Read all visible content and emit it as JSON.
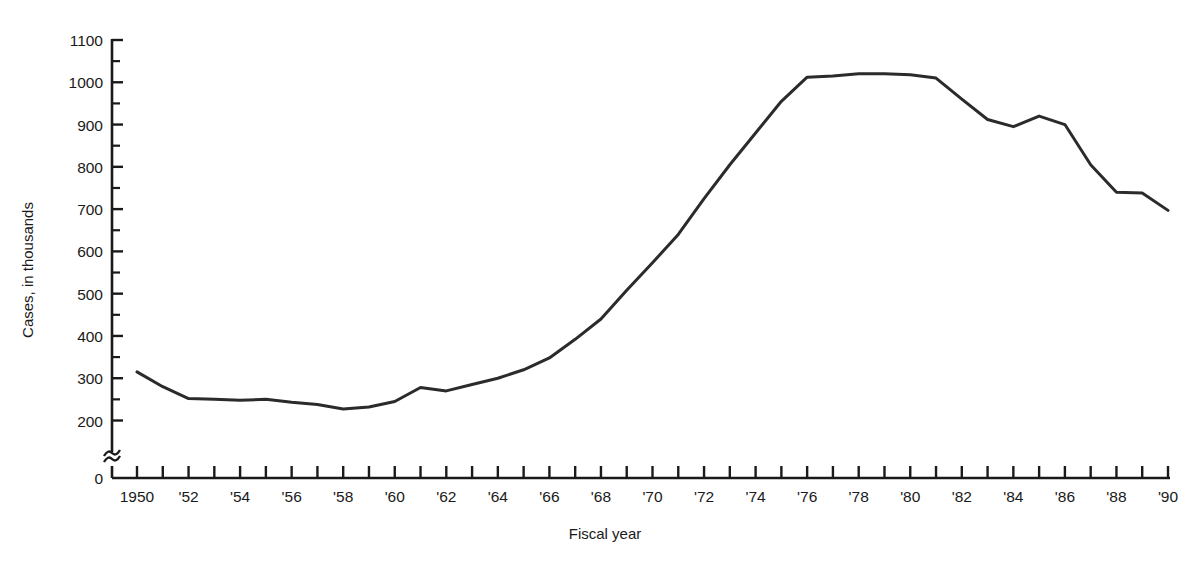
{
  "chart_data": {
    "type": "line",
    "title": "",
    "xlabel": "Fiscal year",
    "ylabel": "Cases, in thousands",
    "xlim": [
      1950,
      1990
    ],
    "ylim": [
      200,
      1100
    ],
    "y_axis_break": true,
    "y_axis_break_note": "axis broken between 0 and 200",
    "grid": false,
    "legend": null,
    "y_ticks_major": [
      200,
      300,
      400,
      500,
      600,
      700,
      800,
      900,
      1000,
      1100
    ],
    "y_ticks_minor": [
      250,
      350,
      450,
      550,
      650,
      750,
      850,
      950,
      1050
    ],
    "y_tick_labels": [
      "0",
      "200",
      "300",
      "400",
      "500",
      "600",
      "700",
      "800",
      "900",
      "1000",
      "1100"
    ],
    "x_tick_labels": [
      "1950",
      "'52",
      "'54",
      "'56",
      "'58",
      "'60",
      "'62",
      "'64",
      "'66",
      "'68",
      "'70",
      "'72",
      "'74",
      "'76",
      "'78",
      "'80",
      "'82",
      "'84",
      "'86",
      "'88",
      "'90"
    ],
    "x_tick_label_years": [
      1950,
      1952,
      1954,
      1956,
      1958,
      1960,
      1962,
      1964,
      1966,
      1968,
      1970,
      1972,
      1974,
      1976,
      1978,
      1980,
      1982,
      1984,
      1986,
      1988,
      1990
    ],
    "x_ticks_all_years": [
      1950,
      1951,
      1952,
      1953,
      1954,
      1955,
      1956,
      1957,
      1958,
      1959,
      1960,
      1961,
      1962,
      1963,
      1964,
      1965,
      1966,
      1967,
      1968,
      1969,
      1970,
      1971,
      1972,
      1973,
      1974,
      1975,
      1976,
      1977,
      1978,
      1979,
      1980,
      1981,
      1982,
      1983,
      1984,
      1985,
      1986,
      1987,
      1988,
      1989,
      1990
    ],
    "x": [
      1950,
      1951,
      1952,
      1953,
      1954,
      1955,
      1956,
      1957,
      1958,
      1959,
      1960,
      1961,
      1962,
      1963,
      1964,
      1965,
      1966,
      1967,
      1968,
      1969,
      1970,
      1971,
      1972,
      1973,
      1974,
      1975,
      1976,
      1977,
      1978,
      1979,
      1980,
      1981,
      1982,
      1983,
      1984,
      1985,
      1986,
      1987,
      1988,
      1989,
      1990
    ],
    "values": [
      315,
      280,
      252,
      250,
      248,
      250,
      243,
      238,
      227,
      232,
      245,
      278,
      270,
      285,
      300,
      320,
      348,
      392,
      440,
      508,
      573,
      640,
      725,
      805,
      880,
      955,
      1012,
      1015,
      1020,
      1020,
      1018,
      1010,
      960,
      912,
      895,
      920,
      900,
      805,
      740,
      738,
      697
    ],
    "series": [
      {
        "name": "Cases",
        "color": "#2b2b2b",
        "line_width": 3,
        "values": [
          315,
          280,
          252,
          250,
          248,
          250,
          243,
          238,
          227,
          232,
          245,
          278,
          270,
          285,
          300,
          320,
          348,
          392,
          440,
          508,
          573,
          640,
          725,
          805,
          880,
          955,
          1012,
          1015,
          1020,
          1020,
          1018,
          1010,
          960,
          912,
          895,
          920,
          900,
          805,
          740,
          738,
          697
        ]
      }
    ]
  },
  "axis": {
    "y_label": "Cases, in thousands",
    "x_label": "Fiscal year",
    "zero_label": "0"
  },
  "colors": {
    "line": "#2b2b2b",
    "axis": "#1a1a1a",
    "background": "#ffffff"
  }
}
